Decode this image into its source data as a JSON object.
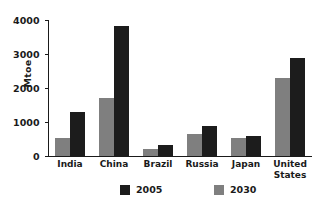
{
  "chart_data": {
    "type": "bar",
    "title": "",
    "xlabel": "",
    "ylabel": "Mtoe",
    "ylim": [
      0,
      4000
    ],
    "yticks": [
      0,
      1000,
      2000,
      3000,
      4000
    ],
    "ytick_labels": [
      "0",
      "1000",
      "2000",
      "3000",
      "4000"
    ],
    "grid": false,
    "legend_position": "bottom",
    "categories": [
      "India",
      "China",
      "Brazil",
      "Russia",
      "Japan",
      "United States"
    ],
    "category_lines": [
      [
        "India"
      ],
      [
        "China"
      ],
      [
        "Brazil"
      ],
      [
        "Russia"
      ],
      [
        "Japan"
      ],
      [
        "United",
        "States"
      ]
    ],
    "series": [
      {
        "name": "2030",
        "color": "#7f7f7f",
        "values": [
          530,
          1700,
          200,
          650,
          540,
          2300
        ]
      },
      {
        "name": "2005",
        "color": "#1c1c1c",
        "values": [
          1290,
          3830,
          320,
          870,
          580,
          2880
        ]
      }
    ],
    "series_draw_order": [
      "2030",
      "2005"
    ],
    "legend": [
      {
        "label": "2005",
        "color": "#1c1c1c"
      },
      {
        "label": "2030",
        "color": "#7f7f7f"
      }
    ]
  },
  "colors": {
    "background": "#ffffff",
    "axis": "#1a1a1a",
    "text": "#1a1a1a",
    "series_2005": "#1c1c1c",
    "series_2030": "#7f7f7f"
  }
}
